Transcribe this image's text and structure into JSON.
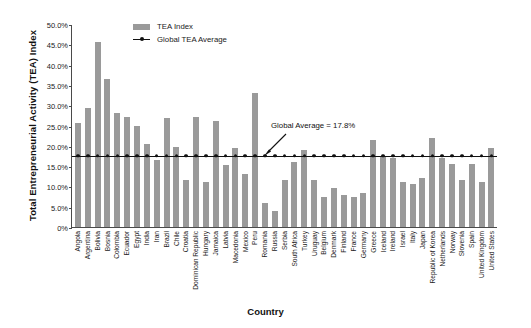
{
  "chart_data": {
    "type": "bar",
    "title": "",
    "xlabel": "Country",
    "ylabel": "Total Entrepreneurial Activity (TEA) Index",
    "ylim": [
      0,
      50
    ],
    "ytick_labels": [
      "50.0%",
      "45.0%",
      "40.0%",
      "35.0%",
      "30.0%",
      "25.0%",
      "20.0%",
      "15.0%",
      "10.0%",
      "5.0%",
      "0%"
    ],
    "ytick_values": [
      50,
      45,
      40,
      35,
      30,
      25,
      20,
      15,
      10,
      5,
      0
    ],
    "grid": false,
    "legend_position": "top-center",
    "categories": [
      "Angola",
      "Argentina",
      "Bolivia",
      "Bosnia",
      "Colombia",
      "Ecuador",
      "Egypt",
      "India",
      "Iran",
      "Brazil",
      "Chile",
      "Croatia",
      "Dominican Republic",
      "Hungary",
      "Jamaica",
      "Latvia",
      "Macedonia",
      "Mexico",
      "Peru",
      "Romania",
      "Russia",
      "Serbia",
      "South Africa",
      "Turkey",
      "Uruguay",
      "Belgium",
      "Denmark",
      "Finland",
      "France",
      "Germany",
      "Greece",
      "Iceland",
      "Ireland",
      "Israel",
      "Italy",
      "Japan",
      "Republic of Korea",
      "Netherlands",
      "Norway",
      "Slovenia",
      "Spain",
      "United Kingdom",
      "United States"
    ],
    "series": [
      {
        "name": "TEA Index",
        "color": "#9a9a9a",
        "values": [
          25.6,
          29.4,
          45.5,
          36.5,
          28.0,
          27.0,
          25.0,
          20.5,
          16.5,
          26.8,
          19.7,
          11.5,
          27.0,
          11.2,
          26.0,
          15.3,
          19.5,
          13.0,
          32.9,
          6.0,
          4.0,
          11.5,
          16.0,
          19.0,
          11.5,
          7.5,
          9.5,
          8.0,
          7.5,
          8.5,
          21.5,
          17.5,
          17.0,
          11.0,
          10.5,
          12.0,
          22.0,
          17.0,
          15.5,
          11.5,
          15.5,
          11.0,
          19.5
        ]
      }
    ],
    "reference_line": {
      "name": "Global TEA Average",
      "value": 17.8,
      "color": "#111111",
      "marker": "circle"
    },
    "annotations": [
      {
        "text": "Global Average = 17.8%",
        "points_to": "Global TEA Average line"
      }
    ],
    "legend": [
      {
        "label": "TEA Index",
        "type": "bar-swatch",
        "color": "#9a9a9a"
      },
      {
        "label": "Global TEA Average",
        "type": "line-marker",
        "color": "#111111"
      }
    ]
  }
}
